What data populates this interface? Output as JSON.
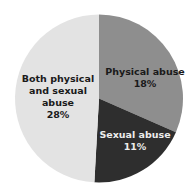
{
  "chart_data": {
    "type": "pie",
    "title": "",
    "categories": [
      "Physical abuse",
      "Sexual abuse",
      "Both physical and sexual abuse"
    ],
    "values": [
      18,
      11,
      28
    ],
    "unit": "%",
    "colors": [
      "#8e8e8e",
      "#2e2e2e",
      "#e3e3e3"
    ],
    "start_angle": "12 o'clock, clockwise",
    "legend": "none (labels inside slices)"
  },
  "labels": {
    "physical": {
      "line1": "Physical abuse",
      "line2": "18%"
    },
    "sexual": {
      "line1": "Sexual abuse",
      "line2": "11%"
    },
    "both": {
      "line1": "Both physical",
      "line2": "and sexual",
      "line3": "abuse",
      "line4": "28%"
    }
  }
}
